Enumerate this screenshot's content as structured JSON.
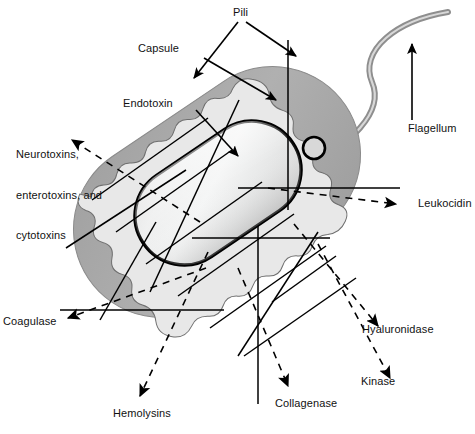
{
  "figure": {
    "background_color": "#ffffff"
  },
  "colors": {
    "capsule": "#a9a9a9",
    "capsule_edge": "#8f8f8f",
    "endotoxin_layer": "#e2e2e2",
    "cytoplasm_light": "#f2f2f2",
    "cytoplasm_mid": "#d4d4d4",
    "cell_wall_outline": "#000000",
    "flagellum": "#9a9a9a",
    "leader_line": "#000000",
    "text": "#111111"
  },
  "structures": [
    {
      "id": "capsule",
      "label": "Capsule",
      "kind": "outer-layer"
    },
    {
      "id": "endotoxin",
      "label": "Endotoxin",
      "kind": "wall-layer"
    },
    {
      "id": "pili",
      "label": "Pili",
      "kind": "appendage"
    },
    {
      "id": "flagellum",
      "label": "Flagellum",
      "kind": "appendage"
    }
  ],
  "secretions": [
    {
      "id": "neurotoxins",
      "label": "Neurotoxins,\nenterotoxins, and\ncytotoxins",
      "arrow": "dashed"
    },
    {
      "id": "leukocidin",
      "label": "Leukocidin",
      "arrow": "dashed"
    },
    {
      "id": "coagulase",
      "label": "Coagulase",
      "arrow": "dashed"
    },
    {
      "id": "hyaluronidase",
      "label": "Hyaluronidase",
      "arrow": "dashed"
    },
    {
      "id": "hemolysins",
      "label": "Hemolysins",
      "arrow": "dashed"
    },
    {
      "id": "kinase",
      "label": "Kinase",
      "arrow": "dashed"
    },
    {
      "id": "collagenase",
      "label": "Collagenase",
      "arrow": "dashed"
    }
  ],
  "labels": {
    "pili": "Pili",
    "capsule": "Capsule",
    "endotoxin": "Endotoxin",
    "flagellum": "Flagellum",
    "neurotoxins_line1": "Neurotoxins,",
    "neurotoxins_line2": "enterotoxins, and",
    "neurotoxins_line3": "cytotoxins",
    "leukocidin": "Leukocidin",
    "coagulase": "Coagulase",
    "hyaluronidase": "Hyaluronidase",
    "kinase": "Kinase",
    "collagenase": "Collagenase",
    "hemolysins": "Hemolysins"
  }
}
